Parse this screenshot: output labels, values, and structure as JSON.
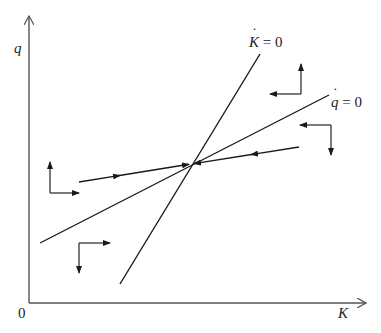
{
  "figure": {
    "type": "phase-diagram",
    "axes": {
      "y_label": "q",
      "x_label": "K",
      "origin_label": "0"
    },
    "curves": [
      {
        "id": "k-dot-zero",
        "label_var": "K",
        "label_rest": " = 0",
        "label": "K̇ = 0",
        "from": [
          120,
          284
        ],
        "to": [
          260,
          54
        ]
      },
      {
        "id": "q-dot-zero",
        "label_var": "q",
        "label_rest": " = 0",
        "label": "q̇ = 0",
        "from": [
          40,
          243
        ],
        "to": [
          329,
          95
        ]
      }
    ],
    "saddle_path": {
      "left_branch": {
        "from": [
          79,
          182
        ],
        "to": [
          191,
          164
        ],
        "direction": "toward-equilibrium"
      },
      "right_branch": {
        "from": [
          299,
          147
        ],
        "to": [
          191,
          164
        ],
        "direction": "toward-equilibrium"
      }
    },
    "equilibrium": [
      191,
      164
    ],
    "direction_arrows": [
      {
        "region": "upper-right",
        "vertical": "up",
        "horizontal": "left"
      },
      {
        "region": "right",
        "vertical": "down",
        "horizontal": "left"
      },
      {
        "region": "left",
        "vertical": "up",
        "horizontal": "right"
      },
      {
        "region": "lower-left",
        "vertical": "down",
        "horizontal": "right"
      }
    ],
    "colors": {
      "line": "#1a1a1a",
      "axis": "#555555",
      "background": "#ffffff"
    }
  }
}
